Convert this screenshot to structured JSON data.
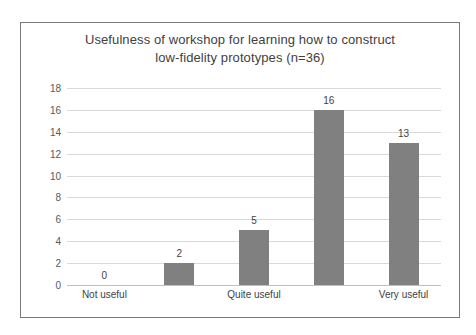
{
  "chart_data": {
    "type": "bar",
    "title": "Usefulness of workshop for learning how to construct low-fidelity prototypes (n=36)",
    "title_lines": [
      "Usefulness of workshop for learning how to construct",
      "low-fidelity prototypes (n=36)"
    ],
    "categories": [
      "Not useful",
      "",
      "Quite useful",
      "",
      "Very useful"
    ],
    "visible_tick_labels": [
      "Not useful",
      "Quite useful",
      "Very useful"
    ],
    "values": [
      0,
      2,
      5,
      16,
      13
    ],
    "data_labels": [
      "0",
      "2",
      "5",
      "16",
      "13"
    ],
    "xlabel": "",
    "ylabel": "",
    "ylim": [
      0,
      18
    ],
    "ytick_step": 2,
    "ytick_labels": [
      "0",
      "2",
      "4",
      "6",
      "8",
      "10",
      "12",
      "14",
      "16",
      "18"
    ],
    "grid": true,
    "legend": false,
    "bar_color": "#808080",
    "gridline_color": "#d9d9d9",
    "text_color": "#3f3f3f",
    "axis_label_color": "#595959",
    "border_color": "#7b7b7b",
    "background_color": "#ffffff"
  }
}
